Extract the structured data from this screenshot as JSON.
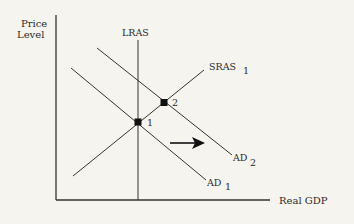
{
  "diagram": {
    "type": "AD-AS model",
    "background": "#f5f4ee",
    "line_color": "#333333",
    "axes": {
      "y_label_line1": "Price",
      "y_label_line2": "Level",
      "x_label": "Real GDP"
    },
    "curves": {
      "lras": {
        "label": "LRAS"
      },
      "sras": {
        "label": "SRAS",
        "subscript": "1"
      },
      "ad1": {
        "label": "AD",
        "subscript": "1"
      },
      "ad2": {
        "label": "AD",
        "subscript": "2"
      }
    },
    "points": [
      {
        "label": "1"
      },
      {
        "label": "2"
      }
    ],
    "arrow": {
      "direction": "right",
      "meaning": "AD shifts right from AD1 to AD2"
    }
  }
}
